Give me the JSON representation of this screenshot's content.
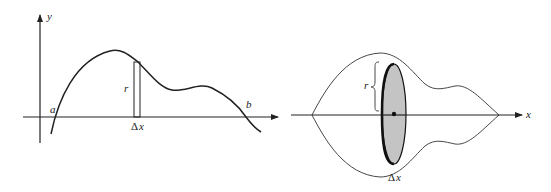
{
  "left_panel": {
    "title": "Area under curve with thin rectangle",
    "axes": {
      "y_label": "y",
      "x_label": ""
    },
    "labels": {
      "a": "a",
      "b": "b",
      "r": "r",
      "delta": "Δ",
      "dx": "x"
    }
  },
  "right_panel": {
    "title": "Solid of revolution with disk slice",
    "axes": {
      "x_label": "x"
    },
    "labels": {
      "r": "r",
      "delta": "Δ",
      "dx": "x"
    },
    "colors": {
      "disk_fill": "#c4c4c4",
      "stroke": "#222222"
    }
  }
}
